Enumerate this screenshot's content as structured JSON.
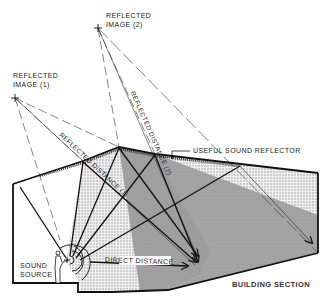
{
  "title": "BUILDING SECTION",
  "labels": {
    "reflected_image_1": [
      "REFLECTED",
      "IMAGE (1)"
    ],
    "reflected_image_2": [
      "REFLECTED",
      "IMAGE (2)"
    ],
    "reflected_distance_1": "REFLECTED DISTANCE (1)",
    "reflected_distance_2": "REFLECTED DISTANCE (2)",
    "useful_sound_reflector": "USEFUL SOUND REFLECTOR",
    "sound_source": [
      "SOUND",
      "SOURCE"
    ],
    "direct_distance": "DIRECT DISTANCE",
    "building_section": "BUILDING SECTION"
  },
  "colors": {
    "line": "#1a1a1a",
    "light_shade": "#d9d9d9",
    "dark_shade": "#a8a8a8",
    "background": "#ffffff"
  }
}
